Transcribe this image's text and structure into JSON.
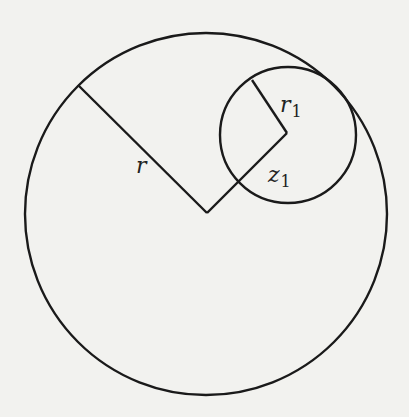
{
  "figure": {
    "background_color": "#f2f2ef",
    "stroke_color": "#1a1a1a",
    "big_circle": {
      "cx": 206,
      "cy": 214,
      "r": 181
    },
    "small_circle": {
      "cx": 288,
      "cy": 135,
      "r": 68
    },
    "segments": [
      {
        "name": "radius-r",
        "x1": 78,
        "y1": 85,
        "x2": 207,
        "y2": 213
      },
      {
        "name": "distance-z1",
        "x1": 207,
        "y1": 213,
        "x2": 287,
        "y2": 133
      },
      {
        "name": "radius-r1",
        "x1": 287,
        "y1": 133,
        "x2": 252,
        "y2": 80
      }
    ],
    "labels": {
      "r": {
        "main": "r",
        "sub": "",
        "x": 136,
        "y": 173
      },
      "r1": {
        "main": "r",
        "sub": "1",
        "x": 280,
        "y": 112
      },
      "z1": {
        "main": "z",
        "sub": "1",
        "x": 268,
        "y": 182
      }
    }
  }
}
